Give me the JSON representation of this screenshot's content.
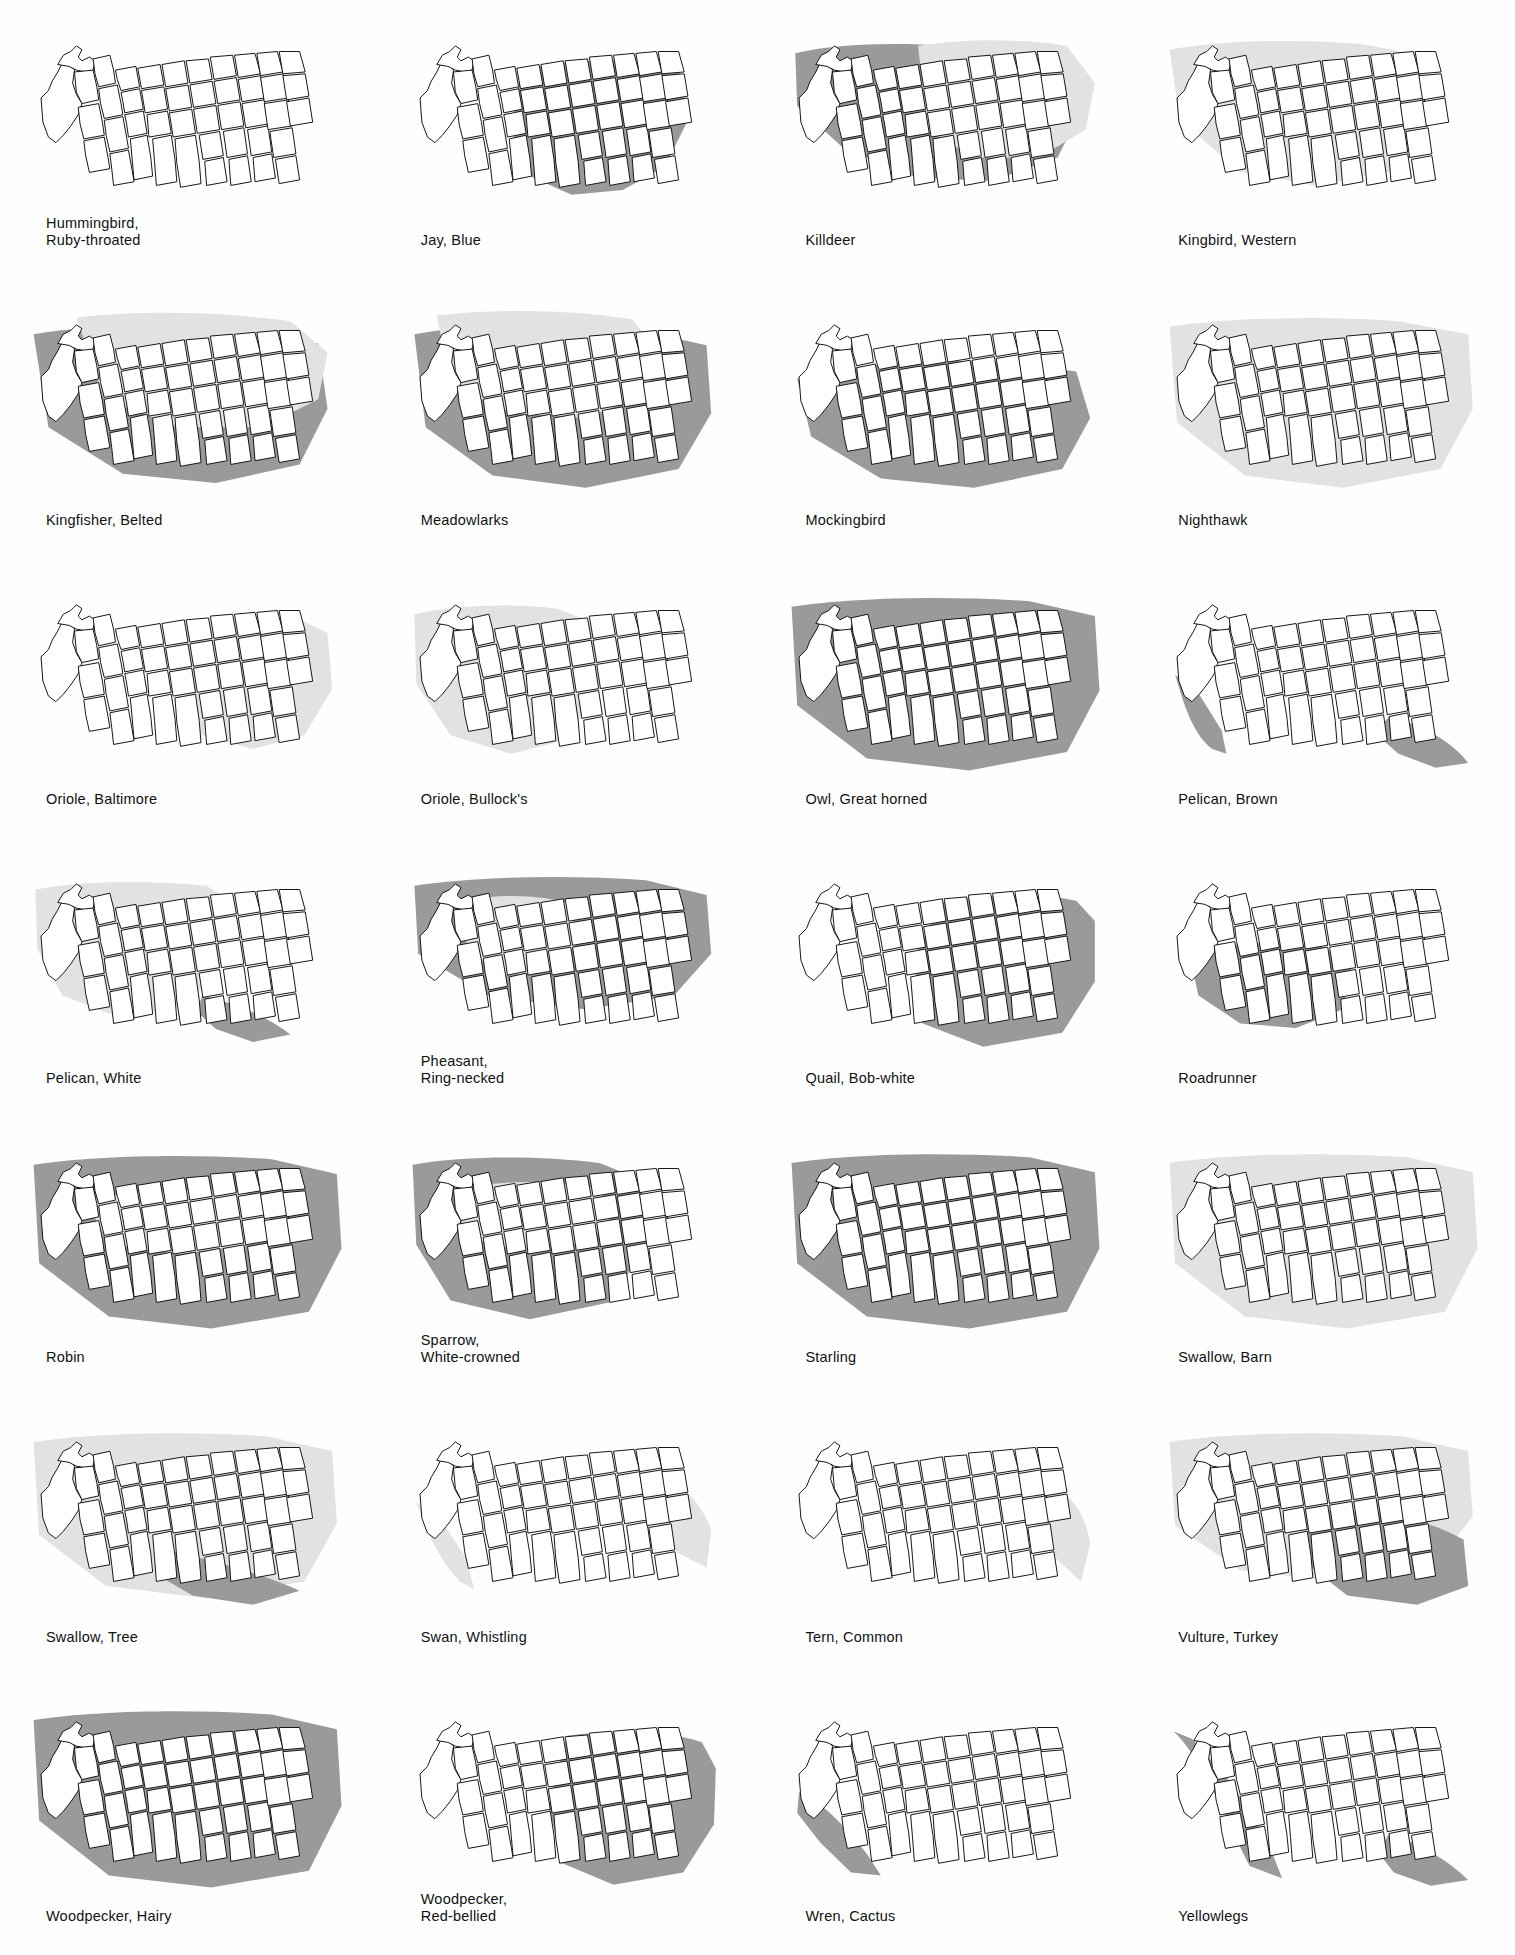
{
  "page": {
    "columns": 4,
    "rows": 7
  },
  "legend": {
    "light_shade_color": "#e2e2e2",
    "dark_shade_color": "#9a9a9a",
    "state_fill_color": "#ffffff",
    "border_color": "#111111",
    "background_color": "#fefefe"
  },
  "maps": [
    {
      "id": "hummingbird-ruby-throated",
      "line1": "Hummingbird,",
      "line2": "Ruby-throated",
      "shade": "light",
      "regions": [
        {
          "tone": "light",
          "d": "M560,95 C600,85 650,82 700,82 L860,82 L900,95 L905,160 L880,200 L800,215 L700,215 L620,210 L575,175 Z"
        }
      ]
    },
    {
      "id": "jay-blue",
      "line1": "Jay, Blue",
      "line2": "",
      "shade": "dark",
      "regions": [
        {
          "tone": "dark",
          "d": "M130,58 C160,48 200,45 240,46 L300,50 L310,110 L285,160 L240,185 L185,190 L140,170 L120,120 Z"
        }
      ]
    },
    {
      "id": "killdeer",
      "line1": "Killdeer",
      "line2": "",
      "shade": "both",
      "regions": [
        {
          "tone": "dark",
          "d": "M18,38 C60,28 120,26 180,30 L300,40 L330,90 L300,150 L230,175 L150,172 L70,140 L20,95 Z"
        },
        {
          "tone": "light",
          "d": "M150,30 C200,22 260,22 310,30 L340,70 L330,120 L280,150 L210,150 L160,120 Z"
        }
      ]
    },
    {
      "id": "kingbird-western",
      "line1": "Kingbird, Western",
      "line2": "",
      "shade": "light",
      "regions": [
        {
          "tone": "light",
          "d": "M14,34 C70,24 150,22 220,28 L285,40 L290,110 L250,165 L170,180 L90,165 L25,110 Z"
        }
      ]
    },
    {
      "id": "kingfisher-belted",
      "line1": "Kingfisher, Belted",
      "line2": "",
      "shade": "both",
      "regions": [
        {
          "tone": "dark",
          "d": "M14,40 C70,30 150,28 230,34 L320,50 L330,120 L300,180 L210,200 L110,190 L30,140 Z"
        },
        {
          "tone": "light",
          "d": "M60,22 C130,14 220,16 290,26 L330,60 L320,110 L260,140 L170,140 L90,110 Z"
        }
      ]
    },
    {
      "id": "meadowlarks",
      "line1": "Meadowlarks",
      "line2": "",
      "shade": "both",
      "regions": [
        {
          "tone": "dark",
          "d": "M16,40 C80,28 170,26 250,34 L330,52 L335,125 L300,185 L200,205 L100,192 L28,140 Z"
        },
        {
          "tone": "light",
          "d": "M40,20 C110,12 190,14 250,24 L280,60 L265,105 L200,130 L120,125 L55,95 Z"
        }
      ]
    },
    {
      "id": "mockingbird",
      "line1": "Mockingbird",
      "line2": "",
      "shade": "dark",
      "regions": [
        {
          "tone": "dark",
          "d": "M20,88 C80,72 160,66 240,70 L320,80 L335,130 L305,185 L210,205 L110,195 L35,150 Z"
        }
      ]
    },
    {
      "id": "nighthawk",
      "line1": "Nighthawk",
      "line2": "",
      "shade": "light",
      "regions": [
        {
          "tone": "light",
          "d": "M14,32 C80,22 180,20 260,26 L335,40 L340,120 L305,185 L200,205 L95,192 L22,135 Z"
        }
      ]
    },
    {
      "id": "oriole-baltimore",
      "line1": "Oriole, Baltimore",
      "line2": "",
      "shade": "light",
      "regions": [
        {
          "tone": "light",
          "d": "M165,52 C210,44 260,42 300,46 L330,60 L335,120 L305,170 L250,185 L195,170 L165,125 Z"
        }
      ]
    },
    {
      "id": "oriole-bullocks",
      "line1": "Oriole, Bullock's",
      "line2": "",
      "shade": "light",
      "regions": [
        {
          "tone": "light",
          "d": "M16,40 C60,30 120,28 170,34 L210,50 L215,120 L180,175 L120,190 L55,170 L18,115 Z"
        }
      ]
    },
    {
      "id": "owl-great-horned",
      "line1": "Owl, Great horned",
      "line2": "",
      "shade": "dark",
      "regions": [
        {
          "tone": "dark",
          "d": "M14,32 C80,22 180,20 270,26 L340,42 L345,122 L310,188 L205,208 L95,195 L20,138 Z"
        }
      ]
    },
    {
      "id": "pelican-brown",
      "line1": "Pelican, Brown",
      "line2": "",
      "shade": "dark",
      "regions": [
        {
          "tone": "dark",
          "d": "M20,105 C30,140 40,170 60,185 L75,190 L70,165 L45,125 Z"
        },
        {
          "tone": "dark",
          "d": "M250,150 C290,160 320,180 335,200 L300,205 L260,190 L235,168 Z"
        }
      ]
    },
    {
      "id": "pelican-white",
      "line1": "Pelican, White",
      "line2": "",
      "shade": "both",
      "regions": [
        {
          "tone": "light",
          "d": "M16,36 C70,26 140,26 200,32 L225,48 L220,110 L180,160 L110,175 L45,150 L18,100 Z"
        },
        {
          "tone": "dark",
          "d": "M195,150 C230,158 265,172 290,192 L250,200 L210,186 L190,168 Z"
        }
      ]
    },
    {
      "id": "pheasant-ring-necked",
      "line1": "Pheasant,",
      "line2": "Ring-necked",
      "shade": "both",
      "regions": [
        {
          "tone": "dark",
          "d": "M16,32 C80,22 180,20 265,26 L330,42 L335,105 L295,150 L200,165 L95,150 L20,105 Z"
        },
        {
          "tone": "light",
          "d": "M70,48 C110,40 155,42 185,52 L190,95 L160,125 L110,128 L72,100 Z"
        }
      ]
    },
    {
      "id": "quail-bob-white",
      "line1": "Quail, Bob-white",
      "line2": "",
      "shade": "dark",
      "regions": [
        {
          "tone": "dark",
          "d": "M175,50 C225,40 280,40 320,48 L340,70 L340,135 L305,190 L220,205 L155,180 L145,110 Z"
        }
      ]
    },
    {
      "id": "roadrunner",
      "line1": "Roadrunner",
      "line2": "",
      "shade": "dark",
      "regions": [
        {
          "tone": "dark",
          "d": "M35,105 C80,92 135,90 180,98 L210,118 L200,165 L150,185 L90,180 L45,150 Z"
        }
      ]
    },
    {
      "id": "robin",
      "line1": "Robin",
      "line2": "",
      "shade": "both",
      "regions": [
        {
          "tone": "dark",
          "d": "M14,32 C80,22 180,20 270,26 L340,42 L345,122 L310,190 L205,208 L95,195 L20,138 Z"
        },
        {
          "tone": "light",
          "d": "M70,70 C130,58 200,56 250,64 L270,88 L245,118 L170,128 L95,118 Z"
        }
      ]
    },
    {
      "id": "sparrow-white-crowned",
      "line1": "Sparrow,",
      "line2": "White-crowned",
      "shade": "both",
      "regions": [
        {
          "tone": "dark",
          "d": "M14,32 C70,22 150,22 215,30 L260,48 L265,120 L225,180 L140,198 L55,178 L18,118 Z"
        },
        {
          "tone": "light",
          "d": "M60,58 C110,48 170,48 215,58 L230,85 L205,115 L135,125 L70,110 Z"
        }
      ]
    },
    {
      "id": "starling",
      "line1": "Starling",
      "line2": "",
      "shade": "dark",
      "regions": [
        {
          "tone": "dark",
          "d": "M14,30 C80,20 180,18 270,24 L340,40 L345,122 L310,190 L205,208 L95,195 L20,138 Z"
        }
      ]
    },
    {
      "id": "swallow-barn",
      "line1": "Swallow, Barn",
      "line2": "",
      "shade": "light",
      "regions": [
        {
          "tone": "light",
          "d": "M14,30 C80,20 180,18 270,24 L340,40 L345,122 L310,190 L205,208 L95,195 L20,138 Z"
        }
      ]
    },
    {
      "id": "swallow-tree",
      "line1": "Swallow, Tree",
      "line2": "",
      "shade": "both",
      "regions": [
        {
          "tone": "light",
          "d": "M14,30 C80,20 180,18 265,24 L335,40 L340,118 L305,180 L200,198 L92,185 L20,130 Z"
        },
        {
          "tone": "dark",
          "d": "M150,145 C200,155 255,170 300,190 L250,205 L185,195 L145,172 Z"
        }
      ]
    },
    {
      "id": "swan-whistling",
      "line1": "Swan, Whistling",
      "line2": "",
      "shade": "light",
      "regions": [
        {
          "tone": "light",
          "d": "M18,95 C30,130 45,160 65,180 L80,188 L72,155 L45,115 Z"
        },
        {
          "tone": "light",
          "d": "M265,60 C300,70 325,95 335,125 L330,165 L300,150 L272,110 Z"
        }
      ]
    },
    {
      "id": "tern-common",
      "line1": "Tern, Common",
      "line2": "",
      "shade": "light",
      "regions": [
        {
          "tone": "light",
          "d": "M275,65 C310,78 330,105 335,140 L325,180 L298,155 L275,112 Z"
        }
      ]
    },
    {
      "id": "vulture-turkey",
      "line1": "Vulture, Turkey",
      "line2": "",
      "shade": "both",
      "regions": [
        {
          "tone": "light",
          "d": "M14,30 C80,20 180,18 265,24 L335,40 L340,110 L300,160 L195,180 L90,168 L20,120 Z"
        },
        {
          "tone": "dark",
          "d": "M165,105 C225,100 285,110 330,135 L335,185 L280,205 L205,195 L160,160 Z"
        }
      ]
    },
    {
      "id": "woodpecker-hairy",
      "line1": "Woodpecker, Hairy",
      "line2": "",
      "shade": "dark",
      "regions": [
        {
          "tone": "dark",
          "d": "M14,28 C80,18 180,16 270,22 L340,38 L345,120 L310,190 L205,208 L95,195 L20,136 Z"
        }
      ]
    },
    {
      "id": "woodpecker-red-bellied",
      "line1": "Woodpecker,",
      "line2": "Red-bellied",
      "shade": "dark",
      "regions": [
        {
          "tone": "dark",
          "d": "M180,45 C235,38 290,40 325,52 L340,80 L338,140 L305,192 L230,205 L175,182 L160,120 Z"
        }
      ]
    },
    {
      "id": "wren-cactus",
      "line1": "Wren, Cactus",
      "line2": "",
      "shade": "dark",
      "regions": [
        {
          "tone": "dark",
          "d": "M22,105 C45,115 70,140 95,172 L110,195 L78,192 L45,160 L20,128 Z"
        }
      ]
    },
    {
      "id": "yellowlegs",
      "line1": "Yellowlegs",
      "line2": "",
      "shade": "dark",
      "regions": [
        {
          "tone": "dark",
          "d": "M18,40 C40,60 60,100 80,145 L100,185 L135,198 L120,160 L80,95 L38,48 Z"
        },
        {
          "tone": "dark",
          "d": "M250,150 C285,162 315,180 335,200 L295,206 L255,192 L238,170 Z"
        }
      ]
    }
  ],
  "state_outline_path": "M18,36 L46,34 L66,40 L70,30 L78,34 L84,46 L108,44 L150,40 L196,36 L240,34 L246,58 L252,86 L256,110 L262,140 L268,172 L272,186 L260,188 L252,176 L240,150 L230,120 L222,92 L216,62 L210,40 L176,44 L140,48 L104,52 L72,56 L58,58 Z"
}
